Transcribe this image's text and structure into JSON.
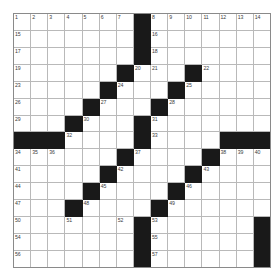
{
  "puzzle": {
    "title": "Crossword Grid",
    "rows": 15,
    "cols": 15,
    "cell_color_white": "#ffffff",
    "cell_color_black": "#191919",
    "grid_line_color": "#b9b9b9",
    "border_color": "#8a8a8a",
    "number_color": "#3b3b3b",
    "black_cells": [
      [
        0,
        7
      ],
      [
        1,
        7
      ],
      [
        2,
        7
      ],
      [
        3,
        6
      ],
      [
        3,
        10
      ],
      [
        4,
        5
      ],
      [
        4,
        9
      ],
      [
        5,
        4
      ],
      [
        5,
        8
      ],
      [
        6,
        3
      ],
      [
        6,
        7
      ],
      [
        7,
        0
      ],
      [
        7,
        1
      ],
      [
        7,
        2
      ],
      [
        7,
        7
      ],
      [
        7,
        12
      ],
      [
        7,
        13
      ],
      [
        7,
        14
      ],
      [
        8,
        6
      ],
      [
        8,
        11
      ],
      [
        9,
        5
      ],
      [
        9,
        10
      ],
      [
        10,
        4
      ],
      [
        10,
        9
      ],
      [
        11,
        3
      ],
      [
        11,
        8
      ],
      [
        12,
        7
      ],
      [
        12,
        14
      ],
      [
        13,
        7
      ],
      [
        13,
        14
      ],
      [
        14,
        7
      ],
      [
        14,
        14
      ]
    ],
    "numbers": [
      {
        "row": 0,
        "col": 0,
        "n": "1"
      },
      {
        "row": 0,
        "col": 1,
        "n": "2"
      },
      {
        "row": 0,
        "col": 2,
        "n": "3"
      },
      {
        "row": 0,
        "col": 3,
        "n": "4"
      },
      {
        "row": 0,
        "col": 4,
        "n": "5"
      },
      {
        "row": 0,
        "col": 5,
        "n": "6"
      },
      {
        "row": 0,
        "col": 6,
        "n": "7"
      },
      {
        "row": 0,
        "col": 8,
        "n": "8"
      },
      {
        "row": 0,
        "col": 9,
        "n": "9"
      },
      {
        "row": 0,
        "col": 10,
        "n": "10"
      },
      {
        "row": 0,
        "col": 11,
        "n": "11"
      },
      {
        "row": 0,
        "col": 12,
        "n": "12"
      },
      {
        "row": 0,
        "col": 13,
        "n": "13"
      },
      {
        "row": 0,
        "col": 14,
        "n": "14"
      },
      {
        "row": 1,
        "col": 0,
        "n": "15"
      },
      {
        "row": 1,
        "col": 8,
        "n": "16"
      },
      {
        "row": 2,
        "col": 0,
        "n": "17"
      },
      {
        "row": 2,
        "col": 8,
        "n": "18"
      },
      {
        "row": 3,
        "col": 0,
        "n": "19"
      },
      {
        "row": 3,
        "col": 7,
        "n": "20"
      },
      {
        "row": 3,
        "col": 8,
        "n": "21"
      },
      {
        "row": 3,
        "col": 11,
        "n": "22"
      },
      {
        "row": 4,
        "col": 0,
        "n": "23"
      },
      {
        "row": 4,
        "col": 6,
        "n": "24"
      },
      {
        "row": 4,
        "col": 10,
        "n": "25"
      },
      {
        "row": 5,
        "col": 0,
        "n": "26"
      },
      {
        "row": 5,
        "col": 5,
        "n": "27"
      },
      {
        "row": 5,
        "col": 9,
        "n": "28"
      },
      {
        "row": 6,
        "col": 0,
        "n": "29"
      },
      {
        "row": 6,
        "col": 4,
        "n": "30"
      },
      {
        "row": 6,
        "col": 8,
        "n": "31"
      },
      {
        "row": 7,
        "col": 3,
        "n": "32"
      },
      {
        "row": 7,
        "col": 8,
        "n": "33"
      },
      {
        "row": 8,
        "col": 0,
        "n": "34"
      },
      {
        "row": 8,
        "col": 1,
        "n": "35"
      },
      {
        "row": 8,
        "col": 2,
        "n": "36"
      },
      {
        "row": 8,
        "col": 7,
        "n": "37"
      },
      {
        "row": 8,
        "col": 12,
        "n": "38"
      },
      {
        "row": 8,
        "col": 13,
        "n": "39"
      },
      {
        "row": 8,
        "col": 14,
        "n": "40"
      },
      {
        "row": 9,
        "col": 0,
        "n": "41"
      },
      {
        "row": 9,
        "col": 6,
        "n": "42"
      },
      {
        "row": 9,
        "col": 11,
        "n": "43"
      },
      {
        "row": 10,
        "col": 0,
        "n": "44"
      },
      {
        "row": 10,
        "col": 5,
        "n": "45"
      },
      {
        "row": 10,
        "col": 10,
        "n": "46"
      },
      {
        "row": 11,
        "col": 0,
        "n": "47"
      },
      {
        "row": 11,
        "col": 4,
        "n": "48"
      },
      {
        "row": 11,
        "col": 9,
        "n": "49"
      },
      {
        "row": 12,
        "col": 0,
        "n": "50"
      },
      {
        "row": 12,
        "col": 3,
        "n": "51"
      },
      {
        "row": 12,
        "col": 6,
        "n": "52"
      },
      {
        "row": 12,
        "col": 8,
        "n": "53"
      },
      {
        "row": 13,
        "col": 0,
        "n": "54"
      },
      {
        "row": 13,
        "col": 8,
        "n": "55"
      },
      {
        "row": 14,
        "col": 0,
        "n": "56"
      },
      {
        "row": 14,
        "col": 8,
        "n": "57"
      }
    ]
  }
}
